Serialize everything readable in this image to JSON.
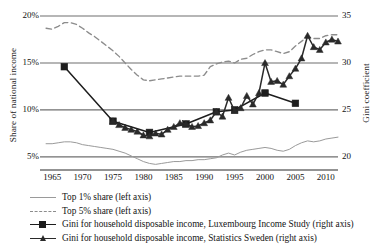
{
  "chart_data": {
    "type": "line",
    "title": "",
    "xlabel": "",
    "ylabel": "Share of national income",
    "ylabel_right": "Gini coefficient",
    "xlim": [
      1963,
      2012
    ],
    "ylim": [
      3.6,
      20
    ],
    "ylim_right": [
      18.6,
      35
    ],
    "grid": true,
    "legend_position": "below",
    "xticks": [
      1965,
      1970,
      1975,
      1980,
      1985,
      1990,
      1995,
      2000,
      2005,
      2010
    ],
    "xtick_labels": [
      "1965",
      "1970",
      "1975",
      "1980",
      "1985",
      "1990",
      "1995",
      "2000",
      "2005",
      "2010"
    ],
    "yticks_left": [
      5,
      10,
      15,
      20
    ],
    "ytick_labels_left": [
      "5%",
      "10%",
      "15%",
      "20%"
    ],
    "yticks_right": [
      20,
      25,
      30,
      35
    ],
    "ytick_labels_right": [
      "20",
      "25",
      "30",
      "35"
    ],
    "series": [
      {
        "name": "Top 1% share (left axis)",
        "axis": "left",
        "style": "solid-thin",
        "color": "#9a9a9a",
        "marker": "none",
        "x": [
          1964,
          1965,
          1966,
          1967,
          1968,
          1969,
          1970,
          1971,
          1972,
          1973,
          1974,
          1975,
          1976,
          1977,
          1978,
          1979,
          1980,
          1981,
          1982,
          1983,
          1984,
          1985,
          1986,
          1987,
          1988,
          1989,
          1990,
          1991,
          1992,
          1993,
          1994,
          1995,
          1996,
          1997,
          1998,
          1999,
          2000,
          2001,
          2002,
          2003,
          2004,
          2005,
          2006,
          2007,
          2008,
          2009,
          2010,
          2011,
          2012
        ],
        "y": [
          6.4,
          6.4,
          6.5,
          6.6,
          6.6,
          6.5,
          6.3,
          6.2,
          6.1,
          6.0,
          5.9,
          5.8,
          5.6,
          5.4,
          5.1,
          4.8,
          4.5,
          4.3,
          4.2,
          4.3,
          4.4,
          4.5,
          4.5,
          4.6,
          4.6,
          4.7,
          4.7,
          4.8,
          4.9,
          5.2,
          5.4,
          5.2,
          5.5,
          5.7,
          5.8,
          5.9,
          6.0,
          5.9,
          5.7,
          5.6,
          5.8,
          6.2,
          6.5,
          6.7,
          6.6,
          6.7,
          6.9,
          7.0,
          7.1
        ]
      },
      {
        "name": "Top 5% share (left axis)",
        "axis": "left",
        "style": "dashed",
        "color": "#8c8c8c",
        "marker": "none",
        "x": [
          1964,
          1965,
          1966,
          1967,
          1968,
          1969,
          1970,
          1971,
          1972,
          1973,
          1974,
          1975,
          1976,
          1977,
          1978,
          1979,
          1980,
          1981,
          1982,
          1983,
          1984,
          1985,
          1986,
          1987,
          1988,
          1989,
          1990,
          1991,
          1992,
          1993,
          1994,
          1995,
          1996,
          1997,
          1998,
          1999,
          2000,
          2001,
          2002,
          2003,
          2004,
          2005,
          2006,
          2007,
          2008,
          2009,
          2010,
          2011,
          2012
        ],
        "y": [
          18.7,
          18.6,
          18.9,
          19.3,
          19.3,
          19.1,
          18.7,
          18.2,
          17.8,
          17.3,
          16.8,
          16.3,
          15.7,
          15.0,
          14.3,
          13.7,
          13.2,
          13.1,
          13.2,
          13.3,
          13.4,
          13.5,
          13.6,
          13.6,
          13.6,
          13.6,
          13.7,
          14.6,
          14.9,
          15.1,
          15.2,
          15.0,
          15.4,
          15.5,
          15.9,
          16.2,
          16.4,
          16.4,
          16.2,
          16.0,
          16.2,
          16.8,
          17.3,
          17.8,
          17.6,
          17.6,
          17.9,
          18.0,
          18.0
        ]
      },
      {
        "name": "Gini for household disposable income, Luxembourg Income Study (right axis)",
        "axis": "right",
        "style": "solid-thick",
        "color": "#1d1d1d",
        "marker": "square",
        "x": [
          1967,
          1975,
          1981,
          1987,
          1992,
          1995,
          2000,
          2005
        ],
        "y": [
          29.6,
          23.8,
          22.6,
          23.5,
          24.8,
          25.0,
          26.8,
          25.7
        ]
      },
      {
        "name": "Gini for household disposable income, Statistics Sweden (right axis)",
        "axis": "right",
        "style": "solid-thick",
        "color": "#2a2a2a",
        "marker": "triangle",
        "x": [
          1975,
          1976,
          1977,
          1978,
          1979,
          1980,
          1981,
          1982,
          1983,
          1984,
          1985,
          1986,
          1987,
          1988,
          1989,
          1990,
          1991,
          1992,
          1993,
          1994,
          1995,
          1996,
          1997,
          1998,
          1999,
          2000,
          2001,
          2002,
          2003,
          2004,
          2005,
          2006,
          2007,
          2008,
          2009,
          2010,
          2011,
          2012
        ],
        "y": [
          23.8,
          23.4,
          23.1,
          22.9,
          22.7,
          22.3,
          22.2,
          22.5,
          22.4,
          22.9,
          23.2,
          23.6,
          23.5,
          23.2,
          23.3,
          23.6,
          23.9,
          24.8,
          24.3,
          26.3,
          24.9,
          25.2,
          26.5,
          25.6,
          26.8,
          30.0,
          28.0,
          28.1,
          27.7,
          28.6,
          29.4,
          30.5,
          32.9,
          31.7,
          31.4,
          32.2,
          32.5,
          32.3
        ]
      }
    ]
  },
  "axes": {
    "left_title": "Share of national income",
    "right_title": "Gini coefficient"
  },
  "legend": {
    "items": [
      {
        "label": "Top 1% share (left axis)",
        "key": "thin-line-key"
      },
      {
        "label": "Top 5% share (left axis)",
        "key": "dashed-line-key"
      },
      {
        "label": "Gini for household disposable income, Luxembourg Income Study (right axis)",
        "key": "square-marker-line-key"
      },
      {
        "label": "Gini for household disposable income, Statistics Sweden (right axis)",
        "key": "triangle-marker-line-key"
      }
    ]
  },
  "colors": {
    "gridline": "#6f6f6f",
    "top1": "#9a9a9a",
    "top5": "#8c8c8c",
    "lis": "#1d1d1d",
    "scb": "#2a2a2a",
    "text": "#131313"
  }
}
